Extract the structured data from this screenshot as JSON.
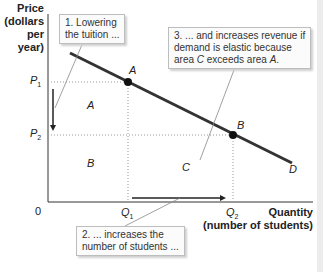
{
  "axes": {
    "y_label_line1": "Price",
    "y_label_line2": "(dollars",
    "y_label_line3": "per year)",
    "x_label_line1": "Quantity",
    "x_label_line2": "(number of students)",
    "origin": "0"
  },
  "ticks": {
    "p1_main": "P",
    "p1_sub": "1",
    "p2_main": "P",
    "p2_sub": "2",
    "q1_main": "Q",
    "q1_sub": "1",
    "q2_main": "Q",
    "q2_sub": "2"
  },
  "points": {
    "a": "A",
    "b": "B",
    "d": "D"
  },
  "areas": {
    "a": "A",
    "b": "B",
    "c": "C"
  },
  "callouts": {
    "one_line1": "1.  Lowering",
    "one_line2": "the tuition ...",
    "two_line1": "2. ... increases the",
    "two_line2": "number of students ...",
    "three_line1": "3. ... and increases revenue if",
    "three_line2": "demand is elastic because",
    "three_pre": "area ",
    "three_c": "C",
    "three_mid": " exceeds area ",
    "three_a": "A",
    "three_end": "."
  },
  "colors": {
    "demand_line": "#333333",
    "axis": "#333333",
    "dotted": "#999999",
    "callout_border": "#bdbdbd"
  }
}
